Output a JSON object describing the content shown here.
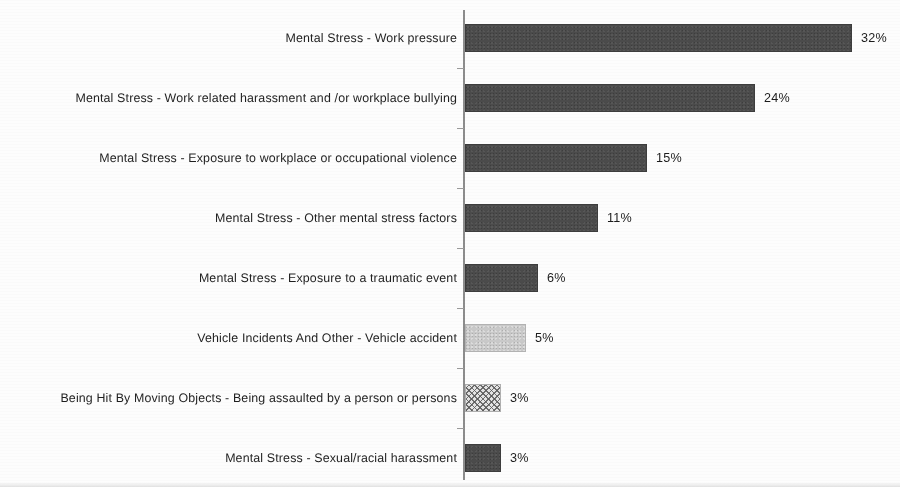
{
  "chart_data": {
    "type": "bar",
    "orientation": "horizontal",
    "title": "",
    "subtitle": "",
    "xlabel": "",
    "ylabel": "",
    "xlim": [
      0,
      35
    ],
    "grid": false,
    "legend": "none",
    "value_suffix": "%",
    "px_per_unit": 12.1,
    "categories": [
      "Mental Stress - Work pressure",
      "Mental Stress - Work related harassment and /or workplace bullying",
      "Mental Stress - Exposure to workplace or occupational violence",
      "Mental Stress - Other mental stress factors",
      "Mental Stress - Exposure to a traumatic event",
      "Vehicle Incidents And Other - Vehicle accident",
      "Being Hit By Moving Objects - Being assaulted by a person or persons",
      "Mental Stress - Sexual/racial harassment"
    ],
    "values": [
      32,
      24,
      15,
      11,
      6,
      5,
      3,
      3
    ],
    "value_labels": [
      "32%",
      "24%",
      "15%",
      "11%",
      "6%",
      "5%",
      "3%",
      "3%"
    ],
    "bar_styles": [
      "solid-dark",
      "solid-dark",
      "solid-dark",
      "solid-dark",
      "solid-dark",
      "solid-light",
      "crosshatch",
      "solid-dark"
    ],
    "colors": {
      "solid_dark": "#4b4b4b",
      "solid_light": "#c9c9c9",
      "crosshatch_fill": "#e4e4e4",
      "crosshatch_line": "#5a5a5a",
      "axis": "#8d8d8d",
      "text": "#1f1f1f",
      "background": "#fdfdfd"
    }
  }
}
